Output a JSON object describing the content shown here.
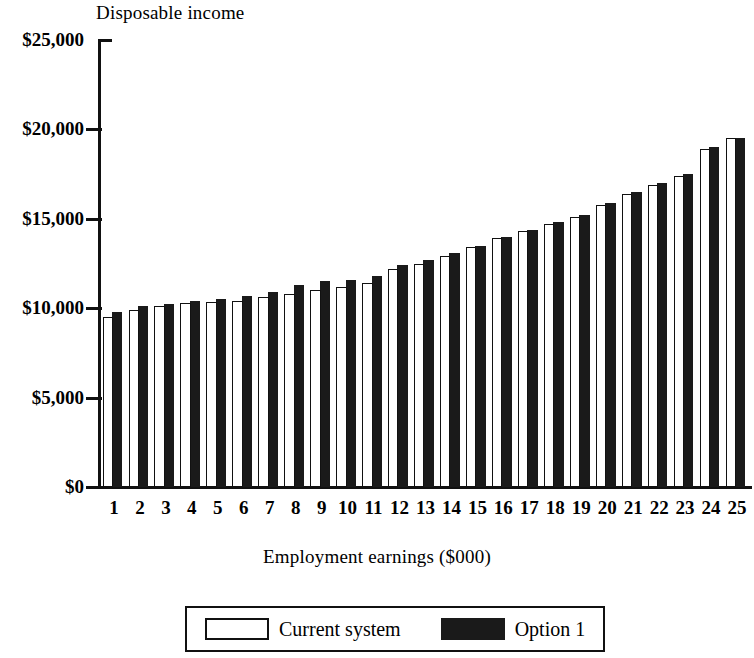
{
  "chart_data": {
    "type": "bar",
    "title": "Disposable income",
    "subtitle": "",
    "xlabel": "Employment earnings ($000)",
    "ylabel": "Disposable income",
    "grid": false,
    "legend_position": "bottom",
    "ylim": [
      0,
      25000
    ],
    "ytick_labels": [
      "$0",
      "$5,000",
      "$10,000",
      "$15,000",
      "$20,000",
      "$25,000"
    ],
    "ytick_values": [
      0,
      5000,
      10000,
      15000,
      20000,
      25000
    ],
    "categories": [
      "1",
      "2",
      "3",
      "4",
      "5",
      "6",
      "7",
      "8",
      "9",
      "10",
      "11",
      "12",
      "13",
      "14",
      "15",
      "16",
      "17",
      "18",
      "19",
      "20",
      "21",
      "22",
      "23",
      "24",
      "25"
    ],
    "series": [
      {
        "name": "Current system",
        "color": "#ffffff",
        "edge_color": "#111111",
        "values": [
          9500,
          9900,
          10100,
          10300,
          10350,
          10400,
          10600,
          10800,
          11000,
          11200,
          11400,
          12200,
          12500,
          12900,
          13400,
          13900,
          14300,
          14700,
          15100,
          15800,
          16400,
          16900,
          17400,
          18900,
          19500
        ]
      },
      {
        "name": "Option 1",
        "color": "#1a1a1a",
        "edge_color": "#1a1a1a",
        "values": [
          9800,
          10100,
          10250,
          10400,
          10500,
          10700,
          10900,
          11300,
          11500,
          11600,
          11800,
          12400,
          12700,
          13100,
          13500,
          14000,
          14400,
          14800,
          15200,
          15900,
          16500,
          17000,
          17500,
          19000,
          19500
        ]
      }
    ]
  },
  "legend": {
    "entries": [
      {
        "label": "Current system",
        "swatch": "hollow-square"
      },
      {
        "label": "Option 1",
        "swatch": "filled-square"
      }
    ]
  },
  "colors": {
    "ink": "#111111",
    "fill_current": "#ffffff",
    "fill_option": "#1a1a1a",
    "background": "#ffffff"
  }
}
